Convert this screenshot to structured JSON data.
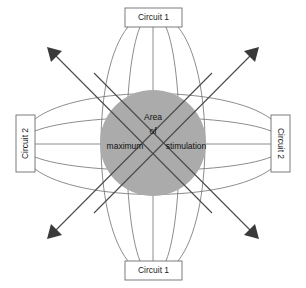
{
  "diagram": {
    "colors": {
      "core_fill": "#ababab",
      "line": "#6e6e6e",
      "arrow": "#3a3a3a",
      "box_fill": "#ffffff",
      "text": "#111111",
      "background": "#ffffff"
    },
    "boxes": [
      {
        "id": "circuit-1-top",
        "label": "Circuit 1",
        "orientation": "horizontal",
        "position": "top"
      },
      {
        "id": "circuit-1-bottom",
        "label": "Circuit 1",
        "orientation": "horizontal",
        "position": "bottom"
      },
      {
        "id": "circuit-2-left",
        "label": "Circuit 2",
        "orientation": "vertical-up",
        "position": "left"
      },
      {
        "id": "circuit-2-right",
        "label": "Circuit 2",
        "orientation": "vertical-down",
        "position": "right"
      }
    ],
    "center_label": {
      "line1": "Area",
      "line2": "of",
      "line3_left": "maximum",
      "line3_right": "stimulation"
    },
    "arrows": [
      {
        "id": "arrow-top-left",
        "direction": "up-left"
      },
      {
        "id": "arrow-top-right",
        "direction": "up-right"
      },
      {
        "id": "arrow-bottom-left",
        "direction": "down-left"
      },
      {
        "id": "arrow-bottom-right",
        "direction": "down-right"
      }
    ],
    "field_line_count_per_axis": 5
  }
}
